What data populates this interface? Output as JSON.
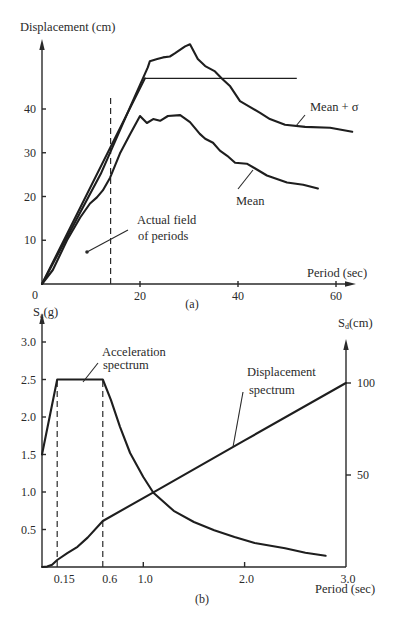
{
  "chart_data": [
    {
      "type": "line",
      "panel_label": "(a)",
      "ylabel": "Displacement (cm)",
      "xlabel": "Period (sec)",
      "origin_label": "0",
      "xlim": [
        0,
        63
      ],
      "ylim": [
        0,
        55
      ],
      "xticks": [
        20,
        40,
        60
      ],
      "yticks": [
        10,
        20,
        30,
        40
      ],
      "grid": false,
      "series": [
        {
          "id": "mean_plus_sigma",
          "name": "Mean + σ",
          "style": "solid",
          "points": [
            [
              0,
              0
            ],
            [
              6,
              12.6
            ],
            [
              12,
              25.2
            ],
            [
              18,
              40.5
            ],
            [
              21.6,
              49.5
            ],
            [
              22.0,
              50.9
            ],
            [
              23.5,
              51.4
            ],
            [
              24.7,
              51.8
            ],
            [
              26.1,
              52.0
            ],
            [
              27.1,
              52.7
            ],
            [
              29.2,
              54.3
            ],
            [
              30.2,
              54.8
            ],
            [
              31.8,
              51.4
            ],
            [
              33.3,
              49.8
            ],
            [
              35.3,
              48.6
            ],
            [
              36.7,
              47.0
            ],
            [
              38.4,
              45.2
            ],
            [
              40.4,
              41.8
            ],
            [
              42.4,
              40.5
            ],
            [
              44.5,
              39.1
            ],
            [
              46.5,
              37.7
            ],
            [
              49.6,
              36.4
            ],
            [
              53.7,
              35.9
            ],
            [
              58.8,
              35.7
            ],
            [
              63.3,
              34.8
            ]
          ]
        },
        {
          "id": "mean",
          "name": "Mean",
          "style": "solid",
          "points": [
            [
              0,
              0
            ],
            [
              2.2,
              3.2
            ],
            [
              5.1,
              10.0
            ],
            [
              7.8,
              15.2
            ],
            [
              9.8,
              18.4
            ],
            [
              11.2,
              19.8
            ],
            [
              12.4,
              21.4
            ],
            [
              13.9,
              24.3
            ],
            [
              15.9,
              29.8
            ],
            [
              18.0,
              34.3
            ],
            [
              20.0,
              38.4
            ],
            [
              21.4,
              36.8
            ],
            [
              22.7,
              37.7
            ],
            [
              24.1,
              37.3
            ],
            [
              25.7,
              38.4
            ],
            [
              28.2,
              38.6
            ],
            [
              30.2,
              37.0
            ],
            [
              32.2,
              34.3
            ],
            [
              33.3,
              33.2
            ],
            [
              34.9,
              32.3
            ],
            [
              36.3,
              30.5
            ],
            [
              37.8,
              29.3
            ],
            [
              39.4,
              27.7
            ],
            [
              41.8,
              27.5
            ],
            [
              43.5,
              26.4
            ],
            [
              45.9,
              24.8
            ],
            [
              50.0,
              23.2
            ],
            [
              53.3,
              22.7
            ],
            [
              56.3,
              21.8
            ]
          ]
        },
        {
          "id": "envelope",
          "name": "",
          "style": "solid",
          "points": [
            [
              0,
              0
            ],
            [
              21,
              47
            ],
            [
              52,
              47
            ]
          ]
        }
      ],
      "reference_lines": [
        {
          "id": "actual_field_of_periods",
          "x": 14,
          "y_range": [
            0,
            43
          ],
          "style": "dashed"
        }
      ],
      "annotations": [
        {
          "id": "mean_plus_sigma_label",
          "lines": [
            "Mean + σ"
          ]
        },
        {
          "id": "mean_label",
          "lines": [
            "Mean"
          ]
        },
        {
          "id": "actual_field_label",
          "lines": [
            "Actual field",
            "of periods"
          ]
        }
      ]
    },
    {
      "type": "line",
      "panel_label": "(b)",
      "xlabel": "Period (sec)",
      "ylabel_left": {
        "symbol": "S",
        "subscript": "a",
        "unit": "(g)"
      },
      "ylabel_right": {
        "symbol": "S",
        "subscript": "d",
        "unit": "(cm)"
      },
      "xlim": [
        0,
        3.0
      ],
      "ylim_left": [
        0,
        3.2
      ],
      "ylim_right": [
        0,
        120
      ],
      "xticks": [
        0.15,
        0.6,
        1.0,
        2.0,
        3.0
      ],
      "xtick_labels": [
        "0.15",
        "0.6",
        "1.0",
        "2.0",
        "3.0"
      ],
      "yticks_left": [
        0.5,
        1.0,
        1.5,
        2.0,
        2.5,
        3.0
      ],
      "ytick_labels_left": [
        "0.5",
        "1.0",
        "1.5",
        "2.0",
        "2.5",
        "3.0"
      ],
      "yticks_right": [
        50,
        100
      ],
      "ytick_labels_right": [
        "50",
        "100"
      ],
      "grid": false,
      "series": [
        {
          "id": "acceleration_spectrum",
          "name": "Acceleration spectrum",
          "axis": "left",
          "unit": "g",
          "points": [
            [
              0,
              1.5
            ],
            [
              0.15,
              2.5
            ],
            [
              0.6,
              2.5
            ],
            [
              0.68,
              2.23
            ],
            [
              0.77,
              1.87
            ],
            [
              0.87,
              1.52
            ],
            [
              1.0,
              1.2
            ],
            [
              1.1,
              0.99
            ],
            [
              1.3,
              0.75
            ],
            [
              1.5,
              0.6
            ],
            [
              1.7,
              0.49
            ],
            [
              1.9,
              0.4
            ],
            [
              2.1,
              0.32
            ],
            [
              2.4,
              0.25
            ],
            [
              2.6,
              0.19
            ],
            [
              2.8,
              0.15
            ]
          ]
        },
        {
          "id": "displacement_spectrum",
          "name": "Displacement spectrum",
          "axis": "right",
          "unit": "cm",
          "points": [
            [
              0,
              0
            ],
            [
              0.05,
              0.2
            ],
            [
              0.1,
              1.2
            ],
            [
              0.15,
              3.8
            ],
            [
              0.25,
              7.5
            ],
            [
              0.35,
              11
            ],
            [
              0.45,
              16
            ],
            [
              0.6,
              25
            ],
            [
              1.1,
              40.6
            ],
            [
              2.0,
              68.8
            ],
            [
              3.0,
              100
            ]
          ]
        }
      ],
      "reference_lines": [
        {
          "id": "t_0_15",
          "x": 0.15,
          "y_range": [
            0,
            2.5
          ],
          "style": "dashed"
        },
        {
          "id": "t_0_6",
          "x": 0.6,
          "y_range": [
            0,
            2.5
          ],
          "style": "dashed"
        }
      ],
      "annotations": [
        {
          "id": "acceleration_label",
          "lines": [
            "Acceleration",
            "spectrum"
          ]
        },
        {
          "id": "displacement_label",
          "lines": [
            "Displacement",
            "spectrum"
          ]
        }
      ]
    }
  ]
}
